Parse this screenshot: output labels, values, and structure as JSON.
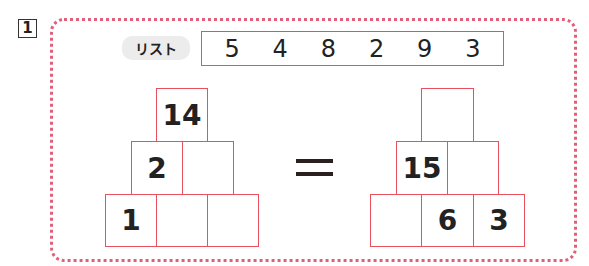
{
  "question_number": "1",
  "list": {
    "label": "リスト",
    "values": [
      "5",
      "4",
      "8",
      "2",
      "9",
      "3"
    ]
  },
  "left_pyramid": {
    "top": [
      "14"
    ],
    "middle": [
      "2",
      ""
    ],
    "bottom": [
      "1",
      "",
      ""
    ]
  },
  "right_pyramid": {
    "top": [
      ""
    ],
    "middle": [
      "15",
      ""
    ],
    "bottom": [
      "",
      "6",
      "3"
    ]
  },
  "operator": "=",
  "colors": {
    "box_border": "#e8505e",
    "dotted_frame": "#e0607a",
    "label_bg": "#ececec"
  }
}
